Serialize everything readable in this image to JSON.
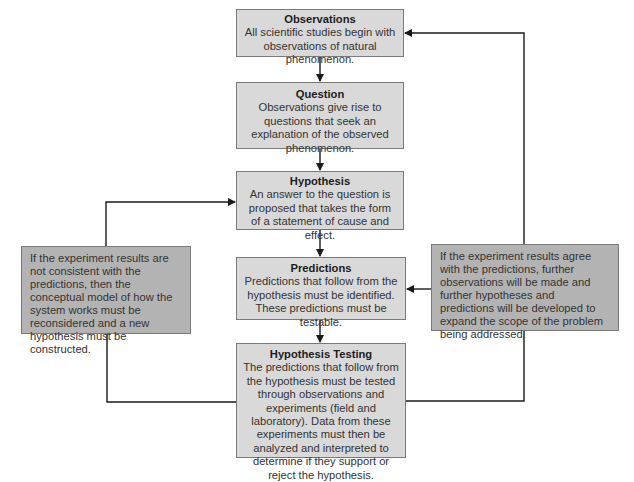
{
  "diagram": {
    "type": "flowchart",
    "nodes": [
      {
        "id": "observations",
        "title": "Observations",
        "text": "All scientific studies begin with observations of natural phenomenon."
      },
      {
        "id": "question",
        "title": "Question",
        "text": "Observations give rise to questions that seek an explanation of the observed phenomenon."
      },
      {
        "id": "hypothesis",
        "title": "Hypothesis",
        "text": "An answer to the question is proposed that takes the form of a statement of cause and effect."
      },
      {
        "id": "predictions",
        "title": "Predictions",
        "text": "Predictions that follow from the hypothesis must be identified. These predictions must be testable."
      },
      {
        "id": "testing",
        "title": "Hypothesis Testing",
        "text": "The predictions that follow from the hypothesis must be tested through observations and experiments (field and laboratory). Data from these experiments must then be analyzed and interpreted to determine if they support or reject the hypothesis."
      },
      {
        "id": "reject",
        "title": "",
        "text": "If the experiment results are not consistent with the predictions, then the conceptual model of how the system works must be reconsidered and a new hypothesis must be constructed."
      },
      {
        "id": "agree",
        "title": "",
        "text": "If the experiment results agree with the predictions, further observations will be made and further hypotheses and predictions will be developed to expand the scope of the problem being addressed."
      }
    ],
    "edges": [
      {
        "from": "observations",
        "to": "question"
      },
      {
        "from": "question",
        "to": "hypothesis"
      },
      {
        "from": "hypothesis",
        "to": "predictions"
      },
      {
        "from": "predictions",
        "to": "testing"
      },
      {
        "from": "testing",
        "to": "reject",
        "via": "left loop"
      },
      {
        "from": "reject",
        "to": "hypothesis"
      },
      {
        "from": "testing",
        "to": "agree",
        "via": "right loop"
      },
      {
        "from": "agree",
        "to": "observations"
      },
      {
        "from": "agree",
        "to": "predictions"
      }
    ],
    "colors": {
      "main_box_fill": "#d9d9d9",
      "side_box_fill": "#b3b3b3",
      "border": "#7a7a7a",
      "line": "#1a1a1a"
    }
  }
}
